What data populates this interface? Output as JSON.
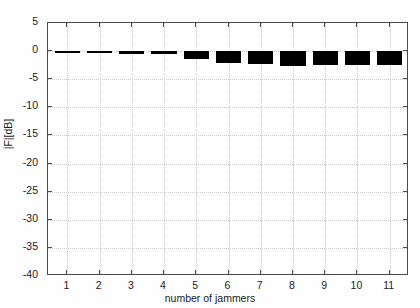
{
  "chart_data": {
    "type": "bar",
    "title": "",
    "xlabel": "number of jammers",
    "ylabel": "|F|[dB]",
    "categories": [
      "1",
      "2",
      "3",
      "4",
      "5",
      "6",
      "7",
      "8",
      "9",
      "10",
      "11"
    ],
    "x": [
      1,
      2,
      3,
      4,
      5,
      6,
      7,
      8,
      9,
      10,
      11
    ],
    "values": [
      -0.05,
      -0.3,
      -0.5,
      -0.5,
      -1.4,
      -2.2,
      -2.3,
      -2.7,
      -2.4,
      -2.4,
      -2.4
    ],
    "xlim": [
      0.4,
      11.6
    ],
    "ylim": [
      -40,
      5
    ],
    "ytick_labels": [
      "5",
      "0",
      "-5",
      "-10",
      "-15",
      "-20",
      "-25",
      "-30",
      "-35",
      "-40"
    ],
    "ytick_values": [
      5,
      0,
      -5,
      -10,
      -15,
      -20,
      -25,
      -30,
      -35,
      -40
    ],
    "xtick_labels": [
      "1",
      "2",
      "3",
      "4",
      "5",
      "6",
      "7",
      "8",
      "9",
      "10",
      "11"
    ],
    "grid": true,
    "legend": "none",
    "bar_color": "#000000",
    "axis_color": "#4a4a4a",
    "grid_color": "#c8c8c8",
    "background_color": "#ffffff"
  }
}
